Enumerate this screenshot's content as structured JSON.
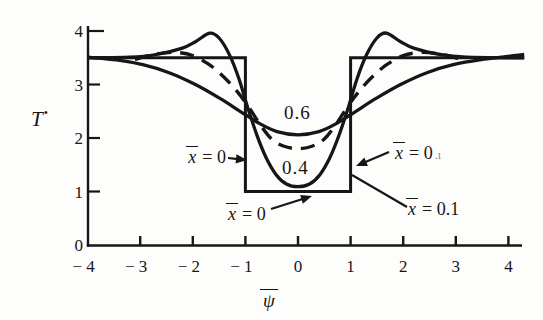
{
  "figure": {
    "ylabel": {
      "base": "T",
      "sup": "•"
    },
    "xlabel": {
      "base": "ψ"
    },
    "curve_labels": {
      "c06": "0.6",
      "c04": "0.4"
    },
    "callouts": {
      "left": {
        "base": "x",
        "eq": "= 0",
        "artifact": ""
      },
      "right": {
        "base": "x",
        "eq": "= 0",
        "artifact": ".ı"
      },
      "bottom": {
        "base": "x",
        "eq": "= 0",
        "artifact": ""
      },
      "curve01": {
        "base": "x",
        "eq": "= 0.1",
        "artifact": ""
      }
    }
  },
  "chart_data": {
    "type": "line",
    "title": "",
    "xlabel": "ψ̄",
    "ylabel": "T*",
    "xlim": [
      -4,
      4
    ],
    "ylim": [
      0,
      4
    ],
    "grid": false,
    "legend": "inline-annotations",
    "ink_color": "#161616",
    "background": "#fdfdfb",
    "xticks": {
      "values": [
        -4,
        -3,
        -2,
        -1,
        0,
        1,
        2,
        3,
        4
      ],
      "labels": [
        "− 4",
        "− 3",
        "− 2",
        "− 1",
        "0",
        "1",
        "2",
        "3",
        "4"
      ]
    },
    "yticks": {
      "values": [
        0,
        1,
        2,
        3,
        4
      ],
      "labels": [
        "0",
        "1",
        "2",
        "3",
        "4"
      ]
    },
    "series": [
      {
        "name": "x̄ = 0 (initial square pulse)",
        "dash": false,
        "smooth": false,
        "width": 3,
        "points": [
          [
            -4,
            3.5
          ],
          [
            -1,
            3.5
          ],
          [
            -1,
            1.0
          ],
          [
            1,
            1.0
          ],
          [
            1,
            3.5
          ],
          [
            4.3,
            3.5
          ]
        ]
      },
      {
        "name": "x̄ = 0.6",
        "dash": false,
        "smooth": true,
        "width": 3.3,
        "points": [
          [
            -4,
            3.51
          ],
          [
            -3.45,
            3.46
          ],
          [
            -2.95,
            3.37
          ],
          [
            -2.45,
            3.22
          ],
          [
            -1.95,
            3.0
          ],
          [
            -1.5,
            2.75
          ],
          [
            -1.1,
            2.5
          ],
          [
            -0.75,
            2.28
          ],
          [
            -0.4,
            2.12
          ],
          [
            0,
            2.06
          ],
          [
            0.4,
            2.12
          ],
          [
            0.75,
            2.28
          ],
          [
            1.1,
            2.5
          ],
          [
            1.5,
            2.75
          ],
          [
            1.95,
            3.0
          ],
          [
            2.45,
            3.22
          ],
          [
            2.95,
            3.37
          ],
          [
            3.45,
            3.46
          ],
          [
            4.3,
            3.56
          ]
        ]
      },
      {
        "name": "x̄ = 0.4",
        "dash": true,
        "smooth": true,
        "width": 3.4,
        "points": [
          [
            -3.1,
            3.47
          ],
          [
            -2.75,
            3.56
          ],
          [
            -2.35,
            3.6
          ],
          [
            -2.0,
            3.54
          ],
          [
            -1.7,
            3.38
          ],
          [
            -1.45,
            3.18
          ],
          [
            -1.2,
            2.92
          ],
          [
            -0.95,
            2.6
          ],
          [
            -0.72,
            2.25
          ],
          [
            -0.5,
            1.98
          ],
          [
            -0.28,
            1.85
          ],
          [
            0,
            1.8
          ],
          [
            0.28,
            1.85
          ],
          [
            0.5,
            1.98
          ],
          [
            0.72,
            2.25
          ],
          [
            0.95,
            2.6
          ],
          [
            1.2,
            2.92
          ],
          [
            1.45,
            3.18
          ],
          [
            1.7,
            3.38
          ],
          [
            2.0,
            3.54
          ],
          [
            2.35,
            3.6
          ],
          [
            2.75,
            3.56
          ],
          [
            3.1,
            3.47
          ]
        ]
      },
      {
        "name": "x̄ = 0.1",
        "dash": false,
        "smooth": true,
        "width": 3.3,
        "points": [
          [
            -4,
            3.5
          ],
          [
            -3.2,
            3.51
          ],
          [
            -2.7,
            3.56
          ],
          [
            -2.2,
            3.68
          ],
          [
            -1.95,
            3.8
          ],
          [
            -1.68,
            3.96
          ],
          [
            -1.5,
            3.87
          ],
          [
            -1.3,
            3.55
          ],
          [
            -1.12,
            3.1
          ],
          [
            -0.95,
            2.55
          ],
          [
            -0.78,
            2.05
          ],
          [
            -0.6,
            1.62
          ],
          [
            -0.42,
            1.32
          ],
          [
            -0.22,
            1.14
          ],
          [
            0,
            1.09
          ],
          [
            0.22,
            1.14
          ],
          [
            0.42,
            1.32
          ],
          [
            0.6,
            1.62
          ],
          [
            0.78,
            2.05
          ],
          [
            0.95,
            2.55
          ],
          [
            1.12,
            3.1
          ],
          [
            1.3,
            3.55
          ],
          [
            1.5,
            3.87
          ],
          [
            1.68,
            3.96
          ],
          [
            1.95,
            3.8
          ],
          [
            2.2,
            3.68
          ],
          [
            2.7,
            3.56
          ],
          [
            3.2,
            3.51
          ],
          [
            4.3,
            3.5
          ]
        ]
      }
    ],
    "annotations": {
      "curve_value_labels": [
        {
          "text": "0.6",
          "at": [
            0.05,
            2.45
          ]
        },
        {
          "text": "0.4",
          "at": [
            0.1,
            1.4
          ]
        }
      ],
      "arrows": [
        {
          "name": "left-x0-arrow",
          "from": [
            -1.331,
            1.626
          ],
          "to": [
            -0.97,
            1.589
          ],
          "head": true
        },
        {
          "name": "right-x0-arrow",
          "from": [
            1.73,
            1.738
          ],
          "to": [
            1.103,
            1.477
          ],
          "head": true
        },
        {
          "name": "bottom-x0-arrow",
          "from": [
            -0.513,
            0.673
          ],
          "to": [
            0.266,
            0.916
          ],
          "head": true
        },
        {
          "name": "x01-callout-line",
          "from": [
            2.072,
            0.71
          ],
          "to": [
            1.027,
            1.308
          ],
          "head": false
        }
      ]
    }
  }
}
